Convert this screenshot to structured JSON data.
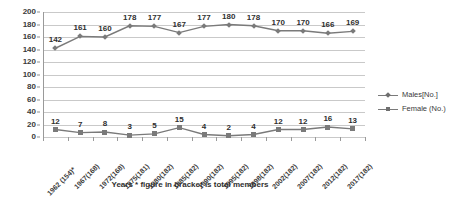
{
  "chart_data": {
    "type": "line",
    "title": "",
    "xlabel": "Years  * figure in bracket is total members",
    "ylabel": "",
    "ylim": [
      0,
      200
    ],
    "ytick_step": 20,
    "yticks": [
      0,
      20,
      40,
      60,
      80,
      100,
      120,
      140,
      160,
      180,
      200
    ],
    "grid": true,
    "legend_position": "right",
    "categories": [
      "1962 (154)*",
      "1967(168)",
      "1972(168)",
      "1975(181)",
      "1980(182)",
      "1985(182)",
      "1990(182)",
      "1995(182)",
      "1998(182)",
      "2002(182)",
      "2007(182)",
      "2012(182)",
      "2017(182)"
    ],
    "series": [
      {
        "name": "Males[No.]",
        "marker": "diamond",
        "color": "#7a7a7a",
        "values": [
          142,
          161,
          160,
          178,
          177,
          167,
          177,
          180,
          178,
          170,
          170,
          166,
          169
        ]
      },
      {
        "name": "Female (No.)",
        "marker": "square",
        "color": "#7a7a7a",
        "values": [
          12,
          7,
          8,
          3,
          5,
          15,
          4,
          2,
          4,
          12,
          12,
          16,
          13
        ]
      }
    ]
  },
  "legend": {
    "items": [
      {
        "label": "Males[No.]"
      },
      {
        "label": "Female (No.)"
      }
    ]
  },
  "axis": {
    "x_title": "Years  * figure in bracket is total members"
  },
  "colors": {
    "line": "#7a7a7a",
    "grid": "#c9c9c9",
    "text": "#3a3a3a",
    "background": "#ffffff"
  }
}
